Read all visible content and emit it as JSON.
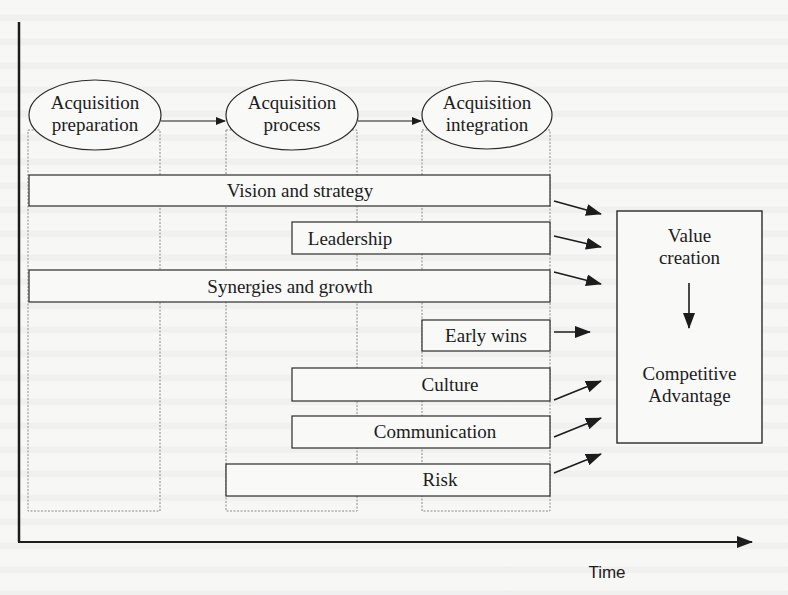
{
  "diagram": {
    "phases": [
      {
        "line1": "Acquisition",
        "line2": "preparation"
      },
      {
        "line1": "Acquisition",
        "line2": "process"
      },
      {
        "line1": "Acquisition",
        "line2": "integration"
      }
    ],
    "bars": [
      {
        "label": "Vision and strategy"
      },
      {
        "label": "Leadership"
      },
      {
        "label": "Synergies and growth"
      },
      {
        "label": "Early wins"
      },
      {
        "label": "Culture"
      },
      {
        "label": "Communication"
      },
      {
        "label": "Risk"
      }
    ],
    "outcome": {
      "top_line1": "Value",
      "top_line2": "creation",
      "bottom_line1": "Competitive",
      "bottom_line2": "Advantage"
    },
    "x_axis_label": "Time",
    "colors": {
      "ink": "#1c1c1c",
      "paper": "#f7f7f6",
      "dotted": "#8a8a8a"
    }
  }
}
